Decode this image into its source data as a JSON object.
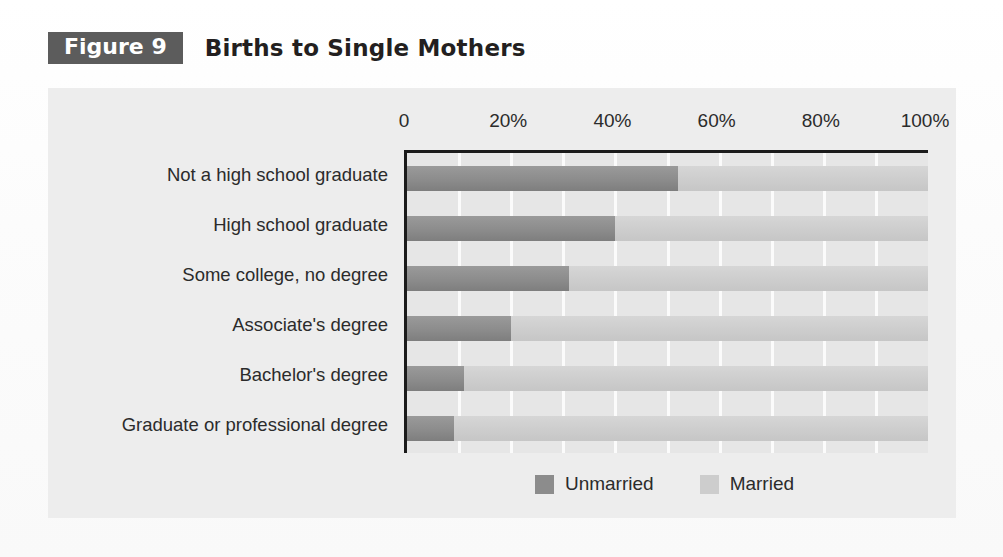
{
  "header": {
    "badge": "Figure 9",
    "title": "Births to Single Mothers"
  },
  "legend": {
    "items": [
      {
        "label": "Unmarried",
        "color": "#8c8c8c",
        "icon": "square-swatch-icon"
      },
      {
        "label": "Married",
        "color": "#cdcdcd",
        "icon": "square-swatch-icon"
      }
    ]
  },
  "axis": {
    "x_ticks": [
      "0",
      "20%",
      "40%",
      "60%",
      "80%",
      "100%"
    ],
    "x_tick_values": [
      0,
      20,
      40,
      60,
      80,
      100
    ]
  },
  "chart_data": {
    "type": "bar",
    "orientation": "horizontal",
    "stacked": true,
    "title": "Births to Single Mothers",
    "xlabel": "",
    "ylabel": "",
    "xlim": [
      0,
      100
    ],
    "x_tick_labels": [
      "0",
      "20%",
      "40%",
      "60%",
      "80%",
      "100%"
    ],
    "x_tick_values": [
      0,
      20,
      40,
      60,
      80,
      100
    ],
    "grid": true,
    "grid_axis": "x",
    "grid_interval": 10,
    "legend_position": "bottom-center",
    "categories": [
      "Not a high school graduate",
      "High school graduate",
      "Some college, no degree",
      "Associate's degree",
      "Bachelor's degree",
      "Graduate or professional degree"
    ],
    "series": [
      {
        "name": "Unmarried",
        "color": "#8c8c8c",
        "values": [
          52,
          40,
          31,
          20,
          11,
          9
        ]
      },
      {
        "name": "Married",
        "color": "#cdcdcd",
        "values": [
          48,
          60,
          69,
          80,
          89,
          91
        ]
      }
    ]
  }
}
